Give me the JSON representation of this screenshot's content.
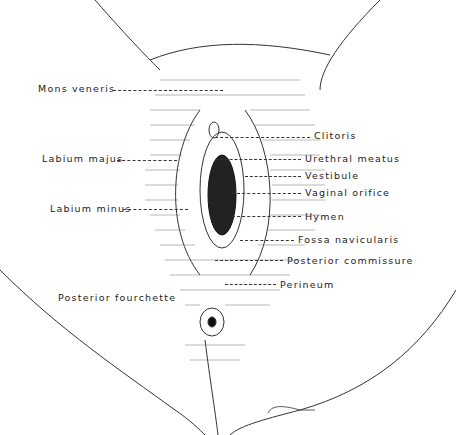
{
  "figure": {
    "type": "anatomical-line-drawing",
    "signature": "Ellagan"
  },
  "labels_left": [
    {
      "text": "Mons veneris",
      "x": 38,
      "y": 83
    },
    {
      "text": "Labium majus",
      "x": 42,
      "y": 153
    },
    {
      "text": "Labium minus",
      "x": 50,
      "y": 203
    },
    {
      "text": "Posterior fourchette",
      "x": 58,
      "y": 292
    }
  ],
  "labels_right": [
    {
      "text": "Clitoris",
      "x": 314,
      "y": 130
    },
    {
      "text": "Urethral meatus",
      "x": 305,
      "y": 153
    },
    {
      "text": "Vestibule",
      "x": 305,
      "y": 170
    },
    {
      "text": "Vaginal orifice",
      "x": 305,
      "y": 187
    },
    {
      "text": "Hymen",
      "x": 305,
      "y": 211
    },
    {
      "text": "Fossa navicularis",
      "x": 298,
      "y": 234
    },
    {
      "text": "Posterior commissure",
      "x": 287,
      "y": 255
    },
    {
      "text": "Perineum",
      "x": 280,
      "y": 279
    }
  ],
  "colors": {
    "ink": "#222222",
    "background": "#ffffff"
  }
}
